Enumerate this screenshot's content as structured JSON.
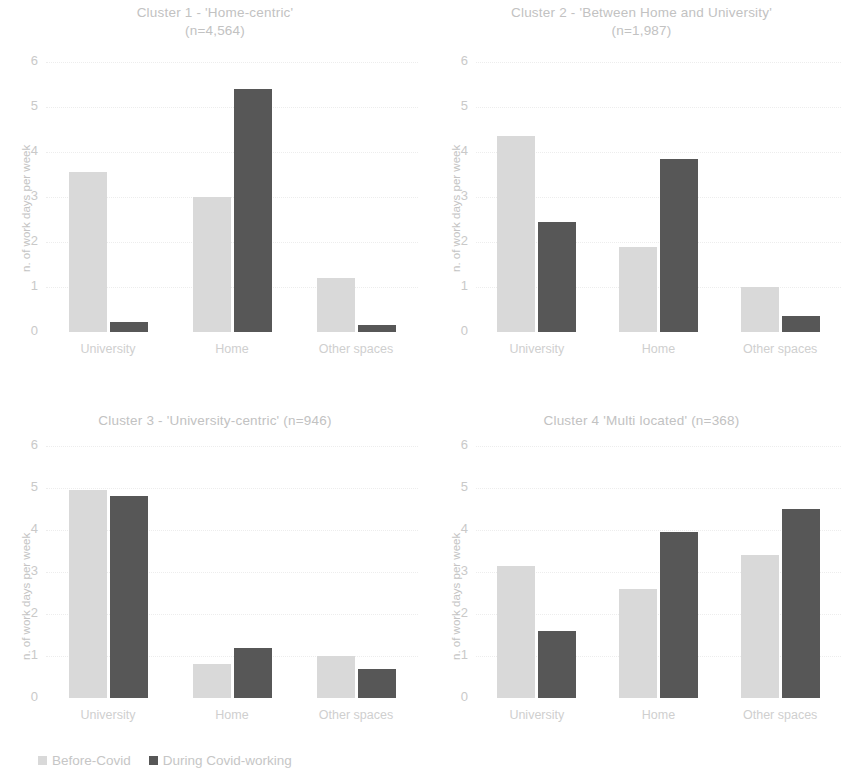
{
  "legend": {
    "items": [
      {
        "label": "Before-Covid",
        "color": "#d9d9d9",
        "icon": "square-swatch-icon"
      },
      {
        "label": "During Covid-working",
        "color": "#575757",
        "icon": "square-swatch-icon"
      }
    ]
  },
  "axis": {
    "ylabel": "n. of work days per week",
    "yticks": [
      "6",
      "5",
      "4",
      "3",
      "2",
      "1",
      "0"
    ],
    "categories": [
      "University",
      "Home",
      "Other spaces"
    ]
  },
  "chart_data": [
    {
      "type": "bar",
      "title": "Cluster 1 -  'Home-centric'\n(n=4,564)",
      "categories": [
        "University",
        "Home",
        "Other spaces"
      ],
      "series": [
        {
          "name": "Before-Covid",
          "values": [
            3.55,
            3.0,
            1.2
          ]
        },
        {
          "name": "During Covid-working",
          "values": [
            0.22,
            5.4,
            0.15
          ]
        }
      ],
      "xlabel": "",
      "ylabel": "n. of work days per week",
      "ylim": [
        0,
        6
      ],
      "grid": true,
      "legend_position": "bottom-left"
    },
    {
      "type": "bar",
      "title": "Cluster 2 -  'Between Home and University'\n(n=1,987)",
      "categories": [
        "University",
        "Home",
        "Other spaces"
      ],
      "series": [
        {
          "name": "Before-Covid",
          "values": [
            4.35,
            1.9,
            1.0
          ]
        },
        {
          "name": "During Covid-working",
          "values": [
            2.45,
            3.85,
            0.35
          ]
        }
      ],
      "xlabel": "",
      "ylabel": "n. of work days per week",
      "ylim": [
        0,
        6
      ],
      "grid": true,
      "legend_position": "bottom-left"
    },
    {
      "type": "bar",
      "title": "Cluster 3 -  'University-centric' (n=946)",
      "categories": [
        "University",
        "Home",
        "Other spaces"
      ],
      "series": [
        {
          "name": "Before-Covid",
          "values": [
            4.95,
            0.8,
            1.0
          ]
        },
        {
          "name": "During Covid-working",
          "values": [
            4.8,
            1.2,
            0.7
          ]
        }
      ],
      "xlabel": "",
      "ylabel": "n. of work days per week",
      "ylim": [
        0,
        6
      ],
      "grid": true,
      "legend_position": "bottom-left"
    },
    {
      "type": "bar",
      "title": "Cluster 4   'Multi located' (n=368)",
      "categories": [
        "University",
        "Home",
        "Other spaces"
      ],
      "series": [
        {
          "name": "Before-Covid",
          "values": [
            3.15,
            2.6,
            3.4
          ]
        },
        {
          "name": "During Covid-working",
          "values": [
            1.6,
            3.95,
            4.5
          ]
        }
      ],
      "xlabel": "",
      "ylabel": "n. of work days per week",
      "ylim": [
        0,
        6
      ],
      "grid": true,
      "legend_position": "bottom-left"
    }
  ]
}
